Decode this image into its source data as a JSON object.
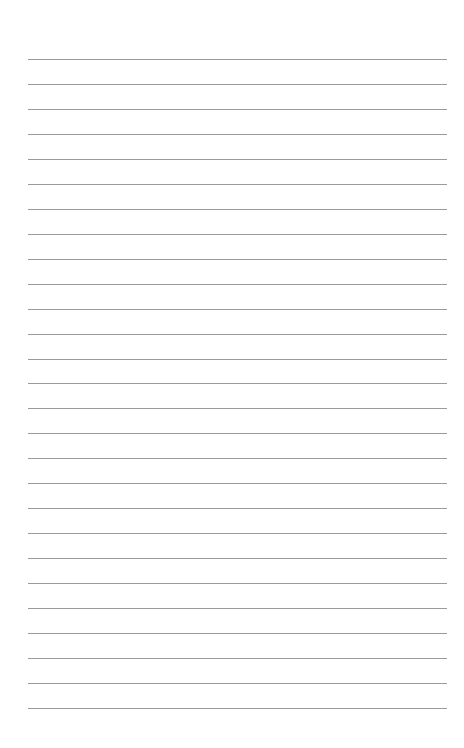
{
  "page": {
    "type": "lined-paper",
    "background": "#ffffff",
    "line_color": "#8a8a8a",
    "line_count": 27,
    "first_line_y": 59,
    "line_spacing": 24.96,
    "line_left": 28,
    "line_right": 447
  }
}
